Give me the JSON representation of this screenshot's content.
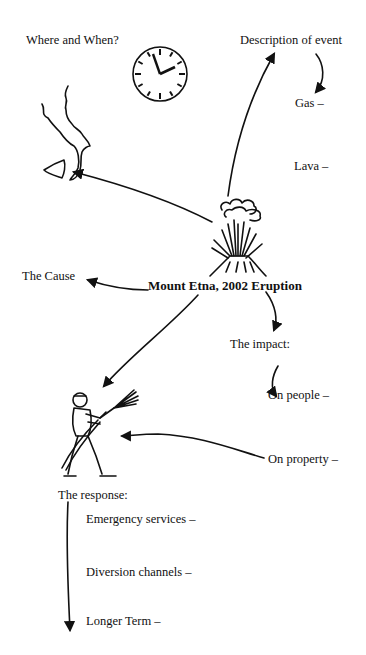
{
  "diagram": {
    "title": "Mount Etna, 2002 Eruption",
    "nodes": {
      "where_when": "Where and When?",
      "description": "Description of event",
      "gas": "Gas –",
      "lava": "Lava –",
      "cause": "The Cause",
      "impact": "The impact:",
      "on_people": "On people –",
      "on_property": "On property –",
      "response": "The response:",
      "emergency_services": "Emergency services –",
      "diversion_channels": "Diversion channels –",
      "longer_term": "Longer Term –"
    },
    "icons": [
      "clock-icon",
      "italy-sicily-map-icon",
      "volcano-icon",
      "firefighter-icon"
    ]
  }
}
